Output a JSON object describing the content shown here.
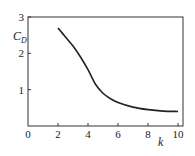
{
  "chart_data": {
    "type": "line",
    "title": "",
    "xlabel": "k",
    "ylabel": "C_D",
    "xlim": [
      0,
      10
    ],
    "ylim": [
      0,
      3
    ],
    "xticks": [
      0,
      2,
      4,
      6,
      8,
      10
    ],
    "yticks": [
      1,
      2,
      3
    ],
    "grid": false,
    "legend": null,
    "series": [
      {
        "name": "C_D vs k",
        "x": [
          2,
          2.5,
          3,
          3.5,
          4,
          4.5,
          5,
          5.5,
          6,
          7,
          8,
          9,
          10
        ],
        "y": [
          2.7,
          2.45,
          2.2,
          1.9,
          1.55,
          1.15,
          0.9,
          0.75,
          0.65,
          0.52,
          0.45,
          0.41,
          0.4
        ]
      }
    ]
  },
  "labels": {
    "x_axis": "k",
    "y_axis_main": "C",
    "y_axis_sub": "D",
    "x_ticks": [
      "0",
      "2",
      "4",
      "6",
      "8",
      "10"
    ],
    "y_ticks": [
      "1",
      "2",
      "3"
    ]
  },
  "colors": {
    "line": "#222222",
    "axis": "#333333"
  }
}
